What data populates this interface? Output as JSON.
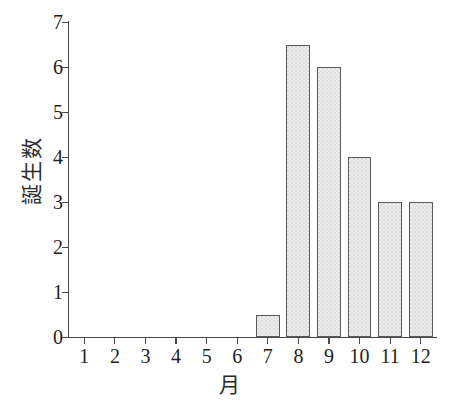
{
  "chart_data": {
    "type": "bar",
    "title": "",
    "subtitle": "",
    "xlabel": "月",
    "ylabel": "誕生数",
    "categories": [
      "1",
      "2",
      "3",
      "4",
      "5",
      "6",
      "7",
      "8",
      "9",
      "10",
      "11",
      "12"
    ],
    "values": [
      0,
      0,
      0,
      0,
      0,
      0,
      0.5,
      6.5,
      6,
      4,
      3,
      3
    ],
    "series": [
      {
        "name": "誕生数",
        "values": [
          0,
          0,
          0,
          0,
          0,
          0,
          0.5,
          6.5,
          6,
          4,
          3,
          3
        ]
      }
    ],
    "ylim": [
      0,
      7
    ],
    "yticks": [
      0,
      1,
      2,
      3,
      4,
      5,
      6,
      7
    ],
    "ytick_labels": [
      "0",
      "1",
      "2",
      "3",
      "4",
      "5",
      "6",
      "7"
    ],
    "xtick_labels": [
      "1",
      "2",
      "3",
      "4",
      "5",
      "6",
      "7",
      "8",
      "9",
      "10",
      "11",
      "12"
    ],
    "grid": false,
    "legend": false,
    "legend_position": "none",
    "bar_fill_color": "#ededed",
    "bar_edge_color": "#5a5a5a",
    "axis_color": "#4a4a4a",
    "background_color": "#ffffff",
    "annotations": []
  }
}
